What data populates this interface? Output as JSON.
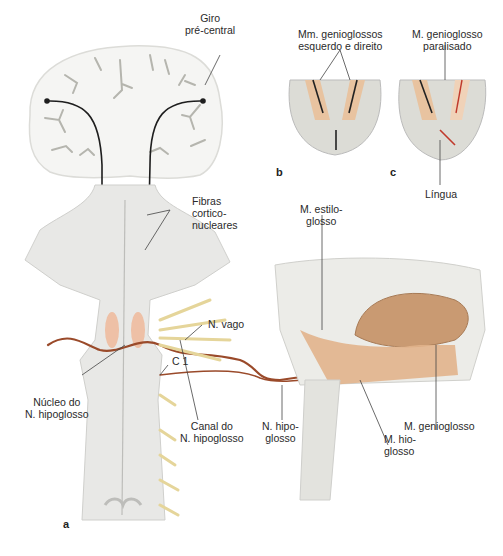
{
  "figure": {
    "panels": [
      {
        "id": "a",
        "letter": "a",
        "description": "Corticonuclear pathway to hypoglossal nucleus and peripheral course of N. hipoglosso"
      },
      {
        "id": "b",
        "letter": "b",
        "description": "Tongue protrusion with both genioglossus muscles intact"
      },
      {
        "id": "c",
        "letter": "c",
        "description": "Tongue deviation with paralysed genioglossus"
      }
    ],
    "labels": {
      "giro": "Giro\npré-central",
      "fibras": "Fibras\ncortico-\nnucleares",
      "mm_genioglossos": "Mm. genioglossos\nesquerdo e direito",
      "m_genioglosso_paralisado": "M. genioglosso\nparalisado",
      "lingua": "Língua",
      "m_estiloglosso": "M. estilo-\nglosso",
      "n_vago": "N. vago",
      "c1": "C 1",
      "nucleo": "Núcleo do\nN. hipoglosso",
      "canal": "Canal do\nN. hipoglosso",
      "n_hipoglosso": "N. hipo-\nglosso",
      "m_genioglosso": "M. genioglosso",
      "m_hioglosso": "M. hio-\nglosso"
    },
    "colors": {
      "nerve": "#9a4a2a",
      "muscle": "#e8c3a0",
      "tongue": "#c99a72",
      "brain_tissue": "#f4f4f2",
      "sulci": "#b9b9b2",
      "brainstem": "#e6e6e4",
      "spinal_nerve": "#e9dfa8",
      "pathway": "#1e1e1e",
      "paralysed_arrow": "#c0392b"
    }
  }
}
